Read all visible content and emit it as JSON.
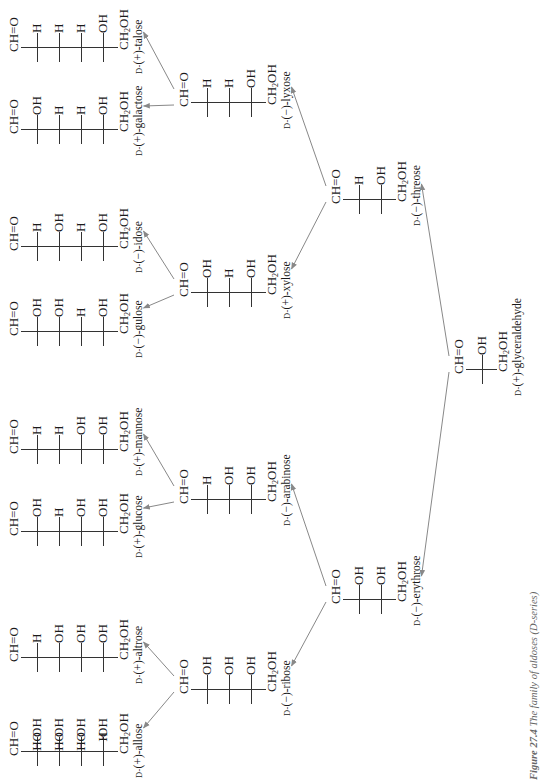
{
  "figure": {
    "caption_label": "Figure 27.4",
    "caption_text": "The family of aldoses (D-series)",
    "orientation": "rotated 90° counter-clockwise",
    "arrow_color": "#888888",
    "line_color": "#333333"
  },
  "labels": {
    "cho": "CH=O",
    "ch2oh_main": "CH",
    "ch2oh_sub": "2",
    "ch2oh_tail": "OH",
    "d_prefix": "D-"
  },
  "compounds": [
    {
      "id": "glyceraldehyde",
      "level": "triose",
      "sign": "(+)",
      "name": "glyceraldehyde",
      "full_name": "D-(+)-glyceraldehyde",
      "left": [
        "H"
      ],
      "right": [
        "OH"
      ]
    },
    {
      "id": "erythrose",
      "level": "tetrose",
      "sign": "(−)",
      "name": "erythrose",
      "full_name": "D-(−)-erythrose",
      "left": [
        "H",
        "H"
      ],
      "right": [
        "OH",
        "OH"
      ]
    },
    {
      "id": "threose",
      "level": "tetrose",
      "sign": "(−)",
      "name": "threose",
      "full_name": "D-(−)-threose",
      "left": [
        "HO",
        "H"
      ],
      "right": [
        "H",
        "OH"
      ]
    },
    {
      "id": "ribose",
      "level": "pentose",
      "sign": "(−)",
      "name": "ribose",
      "full_name": "D-(−)-ribose",
      "left": [
        "H",
        "H",
        "H"
      ],
      "right": [
        "OH",
        "OH",
        "OH"
      ]
    },
    {
      "id": "arabinose",
      "level": "pentose",
      "sign": "(−)",
      "name": "arabinose",
      "full_name": "D-(−)-arabinose",
      "left": [
        "HO",
        "H",
        "H"
      ],
      "right": [
        "H",
        "OH",
        "OH"
      ]
    },
    {
      "id": "xylose",
      "level": "pentose",
      "sign": "(+)",
      "name": "xylose",
      "full_name": "D-(+)-xylose",
      "left": [
        "H",
        "HO",
        "H"
      ],
      "right": [
        "OH",
        "H",
        "OH"
      ]
    },
    {
      "id": "lyxose",
      "level": "pentose",
      "sign": "(−)",
      "name": "lyxose",
      "full_name": "D-(−)-lyxose",
      "left": [
        "HO",
        "HO",
        "H"
      ],
      "right": [
        "H",
        "H",
        "OH"
      ]
    },
    {
      "id": "allose",
      "level": "hexose",
      "sign": "(+)",
      "name": "allose",
      "full_name": "D-(+)-allose",
      "left": [
        "H",
        "H",
        "H",
        "H"
      ],
      "right": [
        "OH",
        "OH",
        "OH",
        "OH"
      ]
    },
    {
      "id": "altrose",
      "level": "hexose",
      "sign": "(+)",
      "name": "altrose",
      "full_name": "D-(+)-altrose",
      "left": [
        "HO",
        "H",
        "H",
        "H"
      ],
      "right": [
        "H",
        "OH",
        "OH",
        "OH"
      ]
    },
    {
      "id": "glucose",
      "level": "hexose",
      "sign": "(+)",
      "name": "glucose",
      "full_name": "D-(+)-glucose",
      "left": [
        "H",
        "HO",
        "H",
        "H"
      ],
      "right": [
        "OH",
        "H",
        "OH",
        "OH"
      ]
    },
    {
      "id": "mannose",
      "level": "hexose",
      "sign": "(+)",
      "name": "mannose",
      "full_name": "D-(+)-mannose",
      "left": [
        "HO",
        "HO",
        "H",
        "H"
      ],
      "right": [
        "H",
        "H",
        "OH",
        "OH"
      ]
    },
    {
      "id": "gulose",
      "level": "hexose",
      "sign": "(−)",
      "name": "gulose",
      "full_name": "D-(−)-gulose",
      "left": [
        "H",
        "H",
        "HO",
        "H"
      ],
      "right": [
        "OH",
        "OH",
        "H",
        "OH"
      ]
    },
    {
      "id": "idose",
      "level": "hexose",
      "sign": "(−)",
      "name": "idose",
      "full_name": "D-(−)-idose",
      "left": [
        "HO",
        "H",
        "HO",
        "H"
      ],
      "right": [
        "H",
        "OH",
        "H",
        "OH"
      ]
    },
    {
      "id": "galactose",
      "level": "hexose",
      "sign": "(+)",
      "name": "galactose",
      "full_name": "D-(+)-galactose",
      "left": [
        "H",
        "HO",
        "HO",
        "H"
      ],
      "right": [
        "OH",
        "H",
        "H",
        "OH"
      ]
    },
    {
      "id": "talose",
      "level": "hexose",
      "sign": "(+)",
      "name": "talose",
      "full_name": "D-(+)-talose",
      "left": [
        "HO",
        "HO",
        "HO",
        "H"
      ],
      "right": [
        "H",
        "H",
        "H",
        "OH"
      ]
    }
  ],
  "arrows": [
    {
      "from": "glyceraldehyde",
      "to": "erythrose"
    },
    {
      "from": "glyceraldehyde",
      "to": "threose"
    },
    {
      "from": "erythrose",
      "to": "ribose"
    },
    {
      "from": "erythrose",
      "to": "arabinose"
    },
    {
      "from": "threose",
      "to": "xylose"
    },
    {
      "from": "threose",
      "to": "lyxose"
    },
    {
      "from": "ribose",
      "to": "allose"
    },
    {
      "from": "ribose",
      "to": "altrose"
    },
    {
      "from": "arabinose",
      "to": "glucose"
    },
    {
      "from": "arabinose",
      "to": "mannose"
    },
    {
      "from": "xylose",
      "to": "gulose"
    },
    {
      "from": "xylose",
      "to": "idose"
    },
    {
      "from": "lyxose",
      "to": "galactose"
    },
    {
      "from": "lyxose",
      "to": "talose"
    }
  ]
}
